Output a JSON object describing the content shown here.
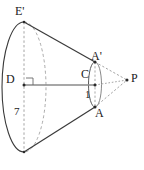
{
  "figure": {
    "kind": "geometry-diagram",
    "colors": {
      "stroke": "#3a3a3a",
      "dashed": "#9a9a9a",
      "background": "#ffffff",
      "label": "#1a1a1a"
    },
    "labels": [
      {
        "id": "E-prime",
        "text": "E'",
        "x": 15,
        "y": 5
      },
      {
        "id": "A-prime",
        "text": "A'",
        "x": 91,
        "y": 50
      },
      {
        "id": "D",
        "text": "D",
        "x": 6,
        "y": 73
      },
      {
        "id": "C",
        "text": "C",
        "x": 81,
        "y": 68
      },
      {
        "id": "P",
        "text": "P",
        "x": 131,
        "y": 72
      },
      {
        "id": "A",
        "text": "A",
        "x": 95,
        "y": 107
      },
      {
        "id": "one",
        "text": "1",
        "x": 85,
        "y": 89
      },
      {
        "id": "seven",
        "text": "7",
        "x": 14,
        "y": 106
      }
    ],
    "measurements": [
      {
        "name": "small-radius",
        "value": "1"
      },
      {
        "name": "large-radius",
        "value": "7"
      }
    ],
    "points": [
      {
        "name": "D",
        "x": 24,
        "y": 85
      },
      {
        "name": "E-prime",
        "x": 24,
        "y": 22
      },
      {
        "name": "E",
        "x": 24,
        "y": 152
      },
      {
        "name": "C",
        "x": 95,
        "y": 85
      },
      {
        "name": "A-prime",
        "x": 95,
        "y": 62
      },
      {
        "name": "A",
        "x": 95,
        "y": 107
      },
      {
        "name": "P",
        "x": 127,
        "y": 80
      }
    ]
  }
}
